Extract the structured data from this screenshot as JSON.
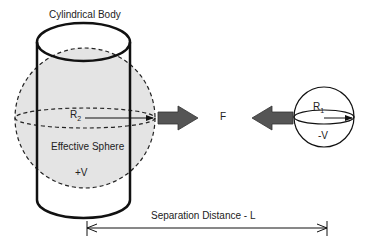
{
  "labels": {
    "cylinder": "Cylindrical Body",
    "effective_sphere": "Effective Sphere",
    "r2_base": "R",
    "r2_sub": "2",
    "r1_base": "R",
    "r1_sub": "1",
    "plus_v": "+V",
    "minus_v": "-V",
    "force": "F",
    "separation": "Separation Distance - L"
  },
  "colors": {
    "sphere_fill": "#e4e4e4",
    "arrow_fill": "#555555",
    "stroke": "#111111"
  }
}
